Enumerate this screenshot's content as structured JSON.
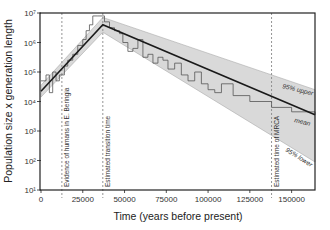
{
  "chart_data": {
    "type": "line",
    "title": "",
    "xlabel": "Time (years before present)",
    "ylabel": "Population size x generation length",
    "xlim": [
      0,
      164000
    ],
    "ylim_log10": [
      1,
      7
    ],
    "yscale": "log",
    "x_ticks": [
      0,
      25000,
      50000,
      75000,
      100000,
      125000,
      150000
    ],
    "x_tick_labels": [
      "0",
      "25000",
      "50000",
      "75000",
      "100000",
      "125000",
      "150000"
    ],
    "y_ticks_log10": [
      1,
      2,
      3,
      4,
      5,
      6,
      7
    ],
    "y_tick_labels": [
      "10¹",
      "10²",
      "10³",
      "10⁴",
      "10⁵",
      "10⁶",
      "10⁷"
    ],
    "grid": false,
    "series": [
      {
        "name": "mean",
        "x": [
          0,
          37000,
          164000
        ],
        "log10_y": [
          4.35,
          6.6,
          3.55
        ]
      },
      {
        "name": "95% upper",
        "x": [
          0,
          37000,
          164000
        ],
        "log10_y": [
          4.55,
          6.85,
          4.4
        ]
      },
      {
        "name": "95% lower",
        "x": [
          0,
          37000,
          164000
        ],
        "log10_y": [
          4.15,
          6.35,
          1.95
        ]
      },
      {
        "name": "skyline (step)",
        "x": [
          0,
          3000,
          5000,
          7000,
          9000,
          11000,
          14000,
          16000,
          19000,
          22000,
          25000,
          27000,
          29000,
          31000,
          34000,
          38000,
          41000,
          44000,
          47000,
          49000,
          52000,
          55000,
          58000,
          61000,
          64000,
          67000,
          70000,
          73000,
          76000,
          80000,
          84000,
          88000,
          92000,
          96000,
          100000,
          104000,
          108000,
          115000,
          125000,
          138000,
          150000,
          164000
        ],
        "log10_y": [
          4.7,
          4.9,
          4.3,
          5.0,
          4.7,
          4.9,
          5.2,
          5.4,
          5.6,
          5.9,
          6.1,
          6.4,
          6.6,
          6.9,
          6.9,
          6.7,
          6.5,
          6.4,
          6.3,
          6.0,
          5.7,
          5.8,
          6.1,
          5.5,
          5.6,
          5.3,
          5.5,
          5.4,
          5.1,
          5.3,
          4.9,
          4.7,
          5.0,
          4.6,
          4.4,
          4.3,
          4.6,
          4.2,
          4.0,
          3.8,
          3.65,
          3.55
        ]
      }
    ],
    "annotations": [
      {
        "text": "Evidence of humans in E. Beringia",
        "x": 12500,
        "orientation": "vertical",
        "style": "dashed"
      },
      {
        "text": "Estimated transition time",
        "x": 37000,
        "orientation": "vertical",
        "style": "dashed"
      },
      {
        "text": "Estimated time of MRCA",
        "x": 138000,
        "orientation": "vertical",
        "style": "dashed"
      }
    ],
    "series_labels": [
      "95% upper",
      "mean",
      "95% lower"
    ]
  },
  "axes": {
    "xlabel": "Time (years before present)",
    "ylabel": "Population size x generation length"
  },
  "colors": {
    "ci_band": "#d9d9d9",
    "mean_line": "#1a1a1a",
    "step_line": "#555555",
    "dashed": "#888888"
  }
}
